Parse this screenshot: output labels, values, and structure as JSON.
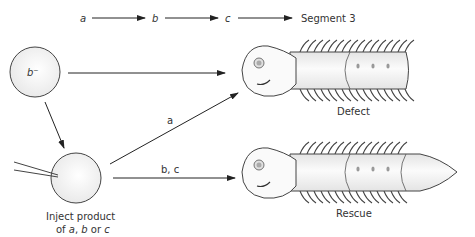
{
  "pathway": {
    "genes": [
      "a",
      "b",
      "c"
    ],
    "output": "Segment 3"
  },
  "mutant_embryo": {
    "label": "b⁻"
  },
  "injected_embryo": {
    "caption_line1": "Inject product",
    "caption_line2_prefix": "of ",
    "caption_a": "a",
    "caption_sep": ", ",
    "caption_b": "b",
    "caption_or": " or ",
    "caption_c": "c"
  },
  "arrows": {
    "diagonal_label": "a",
    "lower_label": "b, c"
  },
  "outcomes": {
    "top": "Defect",
    "bottom": "Rescue"
  },
  "colors": {
    "stroke": "#333333",
    "fill_light": "#f2f2f2",
    "fill_mid": "#e6e6e6",
    "text": "#333333"
  }
}
